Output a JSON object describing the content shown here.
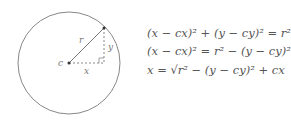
{
  "diagram": {
    "circle": {
      "cx": 69,
      "cy": 63,
      "r": 51,
      "stroke": "#888888"
    },
    "center_label": "c",
    "radius_label": "r",
    "x_label": "x",
    "y_label": "y",
    "point": {
      "x": 104,
      "y": 28
    }
  },
  "equations": [
    "(x − cx)² + (y − cy)² = r²",
    "(x − cx)² = r² − (y − cy)²",
    "x = √r² − (y − cy)² + cx"
  ]
}
